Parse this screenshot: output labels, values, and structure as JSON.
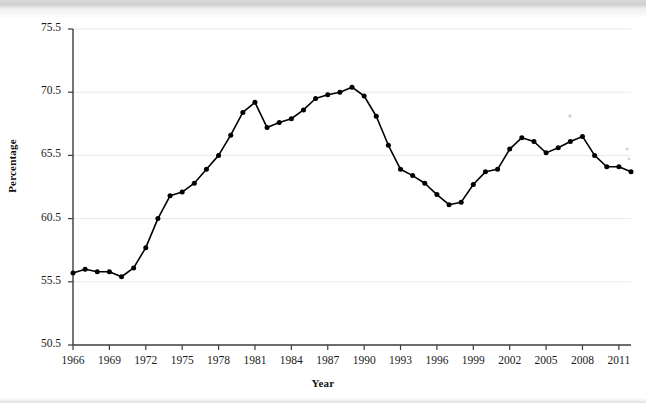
{
  "chart_data": {
    "type": "line",
    "title": "",
    "subtitle": "",
    "xlabel": "Year",
    "ylabel": "Percentage",
    "xlim": [
      1966,
      2012
    ],
    "ylim": [
      50.5,
      75.5
    ],
    "ytick_step": 5,
    "xtick_step": 3,
    "grid": true,
    "legend": false,
    "marker": "filled-circle",
    "line_color": "#000000",
    "grid_color": "#e9e9e9",
    "axis_color": "#3c3c3c",
    "yticks": [
      "50.5",
      "55.5",
      "60.5",
      "65.5",
      "70.5",
      "75.5"
    ],
    "ytick_values": [
      50.5,
      55.5,
      60.5,
      65.5,
      70.5,
      75.5
    ],
    "xticks": [
      "1966",
      "1969",
      "1972",
      "1975",
      "1978",
      "1981",
      "1984",
      "1987",
      "1990",
      "1993",
      "1996",
      "1999",
      "2002",
      "2005",
      "2008",
      "2011"
    ],
    "xtick_values": [
      1966,
      1969,
      1972,
      1975,
      1978,
      1981,
      1984,
      1987,
      1990,
      1993,
      1996,
      1999,
      2002,
      2005,
      2008,
      2011
    ],
    "x": [
      1966,
      1967,
      1968,
      1969,
      1970,
      1971,
      1972,
      1973,
      1974,
      1975,
      1976,
      1977,
      1978,
      1979,
      1980,
      1981,
      1982,
      1983,
      1984,
      1985,
      1986,
      1987,
      1988,
      1989,
      1990,
      1991,
      1992,
      1993,
      1994,
      1995,
      1996,
      1997,
      1998,
      1999,
      2000,
      2001,
      2002,
      2003,
      2004,
      2005,
      2006,
      2007,
      2008,
      2009,
      2010,
      2011,
      2012
    ],
    "values": [
      56.2,
      56.5,
      56.3,
      56.3,
      55.9,
      56.6,
      58.2,
      60.5,
      62.3,
      62.6,
      63.3,
      64.4,
      65.5,
      67.1,
      68.9,
      69.7,
      67.7,
      68.1,
      68.4,
      69.1,
      70.0,
      70.3,
      70.5,
      70.9,
      70.2,
      68.6,
      66.3,
      64.4,
      63.9,
      63.3,
      62.4,
      61.6,
      61.8,
      63.2,
      64.2,
      64.4,
      66.0,
      66.9,
      66.6,
      65.7,
      66.1,
      66.6,
      67.0,
      65.5,
      64.6,
      64.6,
      64.2
    ],
    "series_name": "Percentage"
  }
}
